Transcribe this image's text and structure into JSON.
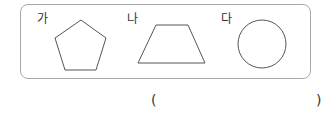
{
  "figures": [
    {
      "label": "가",
      "shape": "pentagon"
    },
    {
      "label": "나",
      "shape": "trapezoid"
    },
    {
      "label": "다",
      "shape": "circle"
    }
  ],
  "answer": {
    "open": "(",
    "close": ")",
    "value": ""
  },
  "colors": {
    "border": "#a9a9a9",
    "stroke": "#555555"
  }
}
